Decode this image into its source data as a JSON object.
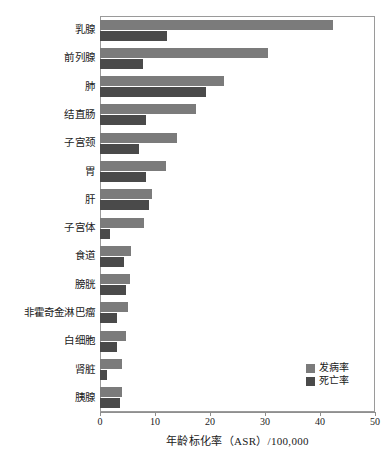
{
  "chart_data": {
    "type": "bar",
    "orientation": "horizontal",
    "title": "",
    "subtitle": "",
    "xlabel": "年龄标化率（ASR）/100,000",
    "ylabel": "",
    "xlim": [
      0,
      50
    ],
    "xticks": [
      0,
      10,
      20,
      30,
      40,
      50
    ],
    "xtick_labels": [
      "0",
      "10",
      "20",
      "30",
      "40",
      "50"
    ],
    "grid": false,
    "legend_position": "bottom-right",
    "categories": [
      "乳腺",
      "前列腺",
      "肺",
      "结直肠",
      "子宫颈",
      "胃",
      "肝",
      "子宫体",
      "食道",
      "膀胱",
      "非霍奇金淋巴瘤",
      "白细胞",
      "肾脏",
      "胰腺"
    ],
    "series": [
      {
        "name": "发病率",
        "color": "#7b7b7b",
        "values": [
          42.4,
          30.5,
          22.5,
          17.5,
          14.0,
          12.0,
          9.4,
          8.0,
          5.6,
          5.5,
          5.0,
          4.7,
          4.0,
          4.0
        ]
      },
      {
        "name": "死亡率",
        "color": "#4a4a4a",
        "values": [
          12.2,
          7.8,
          19.3,
          8.4,
          7.0,
          8.4,
          8.9,
          1.8,
          4.4,
          4.7,
          3.0,
          3.1,
          1.3,
          3.7
        ]
      }
    ]
  },
  "legend": {
    "items": [
      {
        "label": "发病率",
        "color": "#7b7b7b"
      },
      {
        "label": "死亡率",
        "color": "#4a4a4a"
      }
    ]
  },
  "axis": {
    "x_title": "年龄标化率（ASR）/100,000",
    "tick_labels": [
      "0",
      "10",
      "20",
      "30",
      "40",
      "50"
    ]
  }
}
